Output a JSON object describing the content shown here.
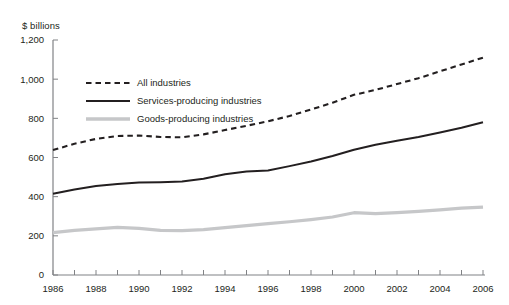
{
  "chart_data": {
    "type": "line",
    "title": "",
    "subtitle": "",
    "xlabel": "",
    "ylabel": "$ billions",
    "ylim": [
      0,
      1200
    ],
    "xlim": [
      1986,
      2006
    ],
    "ytick_labels": [
      "0",
      "200",
      "400",
      "600",
      "800",
      "1,000",
      "1,200"
    ],
    "ytick_values": [
      0,
      200,
      400,
      600,
      800,
      1000,
      1200
    ],
    "xtick_labels": [
      "1986",
      "1988",
      "1990",
      "1992",
      "1994",
      "1996",
      "1998",
      "2000",
      "2002",
      "2004",
      "2006"
    ],
    "xtick_values": [
      1986,
      1988,
      1990,
      1992,
      1994,
      1996,
      1998,
      2000,
      2002,
      2004,
      2006
    ],
    "minor_xticks": [
      1987,
      1989,
      1991,
      1993,
      1995,
      1997,
      1999,
      2001,
      2003,
      2005
    ],
    "grid": false,
    "legend_position": "upper-left-inside",
    "x": [
      1986,
      1987,
      1988,
      1989,
      1990,
      1991,
      1992,
      1993,
      1994,
      1995,
      1996,
      1997,
      1998,
      1999,
      2000,
      2001,
      2002,
      2003,
      2004,
      2005,
      2006
    ],
    "series": [
      {
        "name": "All industries",
        "style": "dashed",
        "color": "#231f20",
        "values": [
          638,
          670,
          695,
          710,
          712,
          705,
          703,
          718,
          740,
          762,
          785,
          812,
          845,
          880,
          920,
          945,
          975,
          1005,
          1040,
          1075,
          1110
        ]
      },
      {
        "name": "Services-producing industries",
        "style": "solid",
        "color": "#231f20",
        "values": [
          415,
          437,
          455,
          465,
          472,
          474,
          478,
          492,
          515,
          528,
          534,
          556,
          580,
          608,
          640,
          665,
          685,
          705,
          728,
          752,
          780
        ]
      },
      {
        "name": "Goods-producing industries",
        "style": "solid",
        "color": "#c6c7c9",
        "values": [
          216,
          228,
          236,
          243,
          238,
          228,
          227,
          232,
          242,
          252,
          262,
          272,
          283,
          296,
          318,
          313,
          318,
          325,
          333,
          341,
          347
        ]
      }
    ]
  },
  "legend": {
    "items": [
      {
        "label": "All industries"
      },
      {
        "label": "Services-producing industries"
      },
      {
        "label": "Goods-producing industries"
      }
    ]
  }
}
